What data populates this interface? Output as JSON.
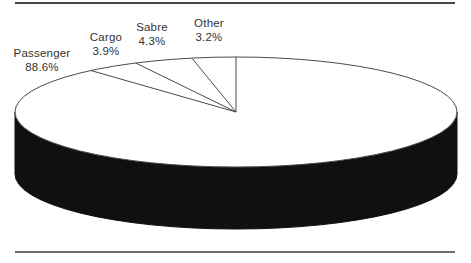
{
  "figure": {
    "background_color": "#ffffff",
    "top_rule_color": "#474747",
    "bottom_rule_color": "#6f6f6f"
  },
  "chart_data": {
    "type": "pie",
    "effect": "3d",
    "title": "",
    "start_angle_deg": 90,
    "direction": "cw",
    "legend_position": "none",
    "labels_position": "outside-top-left",
    "series": [
      {
        "name": "Passenger",
        "value": 88.6,
        "pct_label": "88.6%"
      },
      {
        "name": "Cargo",
        "value": 3.9,
        "pct_label": "3.9%"
      },
      {
        "name": "Sabre",
        "value": 4.3,
        "pct_label": "4.3%"
      },
      {
        "name": "Other",
        "value": 3.2,
        "pct_label": "3.2%"
      }
    ],
    "top_color": "#ffffff",
    "side_color": "#101010",
    "outline_color": "#4a4a4a",
    "label_color": "#333333"
  }
}
